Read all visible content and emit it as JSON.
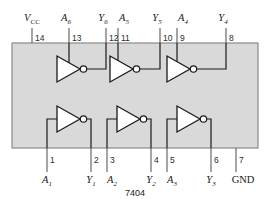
{
  "diagram": {
    "part_number": "7404",
    "package_pin_count": 14,
    "colors": {
      "package_fill": "#d9d9d9",
      "package_stroke": "#8a8a8a",
      "wire": "#5a5a5a",
      "gate_stroke": "#1a1a1a",
      "gate_fill": "#ffffff",
      "background": "#ffffff"
    },
    "top_pins": [
      {
        "number": "14",
        "label_main": "V",
        "label_sub": "CC",
        "italic": true
      },
      {
        "number": "13",
        "label_main": "A",
        "label_sub": "6",
        "italic": true
      },
      {
        "number": "12",
        "label_main": "Y",
        "label_sub": "6",
        "italic": true
      },
      {
        "number": "11",
        "label_main": "A",
        "label_sub": "5",
        "italic": true
      },
      {
        "number": "10",
        "label_main": "Y",
        "label_sub": "5",
        "italic": true
      },
      {
        "number": "9",
        "label_main": "A",
        "label_sub": "4",
        "italic": true
      },
      {
        "number": "8",
        "label_main": "Y",
        "label_sub": "4",
        "italic": true
      }
    ],
    "bottom_pins": [
      {
        "number": "1",
        "label_main": "A",
        "label_sub": "1",
        "italic": true
      },
      {
        "number": "2",
        "label_main": "Y",
        "label_sub": "1",
        "italic": true
      },
      {
        "number": "3",
        "label_main": "A",
        "label_sub": "2",
        "italic": true
      },
      {
        "number": "4",
        "label_main": "Y",
        "label_sub": "2",
        "italic": true
      },
      {
        "number": "5",
        "label_main": "A",
        "label_sub": "3",
        "italic": true
      },
      {
        "number": "6",
        "label_main": "Y",
        "label_sub": "3",
        "italic": true
      },
      {
        "number": "7",
        "label_main": "GND",
        "label_sub": "",
        "italic": false
      }
    ],
    "gates": [
      {
        "name": "inverter-6",
        "row": "top",
        "input_pin": "13",
        "output_pin": "12"
      },
      {
        "name": "inverter-5",
        "row": "top",
        "input_pin": "11",
        "output_pin": "10"
      },
      {
        "name": "inverter-4",
        "row": "top",
        "input_pin": "9",
        "output_pin": "8"
      },
      {
        "name": "inverter-1",
        "row": "bottom",
        "input_pin": "1",
        "output_pin": "2"
      },
      {
        "name": "inverter-2",
        "row": "bottom",
        "input_pin": "3",
        "output_pin": "4"
      },
      {
        "name": "inverter-3",
        "row": "bottom",
        "input_pin": "5",
        "output_pin": "6"
      }
    ]
  }
}
